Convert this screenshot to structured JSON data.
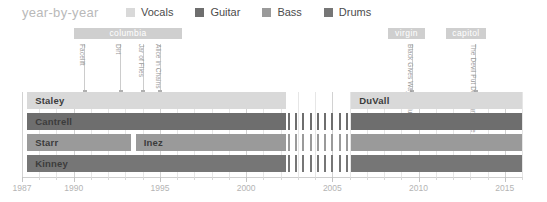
{
  "header": {
    "title": "year-by-year"
  },
  "legend": {
    "items": [
      {
        "label": "Vocals",
        "color": "#d9d9d9"
      },
      {
        "label": "Guitar",
        "color": "#6e6e6e"
      },
      {
        "label": "Bass",
        "color": "#9a9a9a"
      },
      {
        "label": "Drums",
        "color": "#767676"
      }
    ]
  },
  "labels": {
    "bands": [
      {
        "name": "columbia",
        "start_year": 1990.0,
        "end_year": 1996.3
      },
      {
        "name": "virgin",
        "start_year": 2008.2,
        "end_year": 2010.4
      },
      {
        "name": "capitol",
        "start_year": 2011.6,
        "end_year": 2013.9
      }
    ]
  },
  "albums": [
    {
      "title": "Facelift",
      "year": 1990.6
    },
    {
      "title": "Dirt",
      "year": 1992.7
    },
    {
      "title": "Jar of Flies",
      "year": 1994.0
    },
    {
      "title": "Alice in Chains",
      "year": 1995.0
    },
    {
      "title": "Black Gives Way to Blue",
      "year": 2009.6
    },
    {
      "title": "The Devil Put Dinosaurs Here",
      "year": 2013.3
    }
  ],
  "chart_data": {
    "type": "bar",
    "title": "year-by-year",
    "xlabel": "",
    "ylabel": "",
    "xlim": [
      1987,
      2016
    ],
    "grid": true,
    "legend_position": "top",
    "tick_years": [
      1987,
      1990,
      1995,
      2000,
      2005,
      2010,
      2015
    ],
    "tick_labels": [
      "1987",
      "1990",
      "1995",
      "2000",
      "2005",
      "2010",
      "2015"
    ],
    "rows": [
      {
        "role": "Vocals",
        "color": "#d9d9d9",
        "segments": [
          {
            "name": "Staley",
            "start_year": 1987.3,
            "end_year": 2002.3,
            "style": "solid"
          },
          {
            "name": "DuVall",
            "start_year": 2006.1,
            "end_year": 2016.0,
            "style": "solid"
          }
        ]
      },
      {
        "role": "Guitar",
        "color": "#6e6e6e",
        "segments": [
          {
            "name": "Cantrell",
            "start_year": 1987.3,
            "end_year": 2002.3,
            "style": "solid"
          },
          {
            "name": "",
            "start_year": 2002.3,
            "end_year": 2006.1,
            "style": "dashed"
          },
          {
            "name": "",
            "start_year": 2006.1,
            "end_year": 2016.0,
            "style": "solid"
          }
        ]
      },
      {
        "role": "Bass",
        "color": "#9a9a9a",
        "segments": [
          {
            "name": "Starr",
            "start_year": 1987.3,
            "end_year": 1993.3,
            "style": "solid"
          },
          {
            "name": "Inez",
            "start_year": 1993.6,
            "end_year": 2002.3,
            "style": "solid"
          },
          {
            "name": "",
            "start_year": 2002.3,
            "end_year": 2006.1,
            "style": "dashed"
          },
          {
            "name": "",
            "start_year": 2006.1,
            "end_year": 2016.0,
            "style": "solid"
          }
        ]
      },
      {
        "role": "Drums",
        "color": "#767676",
        "segments": [
          {
            "name": "Kinney",
            "start_year": 1987.3,
            "end_year": 2002.3,
            "style": "solid"
          },
          {
            "name": "",
            "start_year": 2002.3,
            "end_year": 2006.1,
            "style": "dashed"
          },
          {
            "name": "",
            "start_year": 2006.1,
            "end_year": 2016.0,
            "style": "solid"
          }
        ]
      }
    ]
  }
}
